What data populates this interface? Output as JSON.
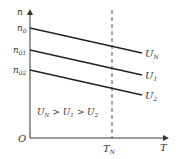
{
  "diagram": {
    "axes": {
      "y_label": "n",
      "x_label": "T",
      "origin_label": "O",
      "x_tick_label": "T",
      "x_tick_sub": "N"
    },
    "y_ticks": [
      {
        "main": "n",
        "sub": "0"
      },
      {
        "main": "n",
        "sub": "01"
      },
      {
        "main": "n",
        "sub": "02"
      }
    ],
    "lines": [
      {
        "main": "U",
        "sub": "N"
      },
      {
        "main": "U",
        "sub": "1"
      },
      {
        "main": "U",
        "sub": "2"
      }
    ],
    "relation": {
      "a": "U",
      "a_sub": "N",
      "op1": " > ",
      "b": "U",
      "b_sub": "1",
      "op2": " > ",
      "c": "U",
      "c_sub": "2"
    },
    "colors": {
      "line": "#222222",
      "axis": "#333333"
    }
  }
}
